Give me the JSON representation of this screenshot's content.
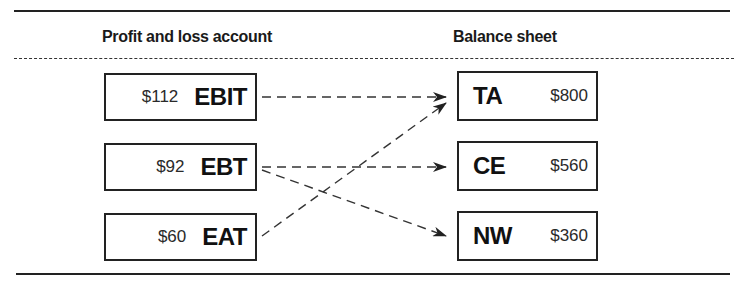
{
  "headings": {
    "left": "Profit and loss account",
    "right": "Balance sheet"
  },
  "profit_and_loss": [
    {
      "code": "EBIT",
      "amount": "$112"
    },
    {
      "code": "EBT",
      "amount": "$92"
    },
    {
      "code": "EAT",
      "amount": "$60"
    }
  ],
  "balance_sheet": [
    {
      "code": "TA",
      "amount": "$800"
    },
    {
      "code": "CE",
      "amount": "$560"
    },
    {
      "code": "NW",
      "amount": "$360"
    }
  ],
  "connections": [
    {
      "from": "EBIT",
      "to": "TA"
    },
    {
      "from": "EBT",
      "to": "CE"
    },
    {
      "from": "EBT",
      "to": "NW"
    },
    {
      "from": "EAT",
      "to": "TA"
    }
  ],
  "colors": {
    "line": "#222222",
    "background": "#ffffff"
  }
}
